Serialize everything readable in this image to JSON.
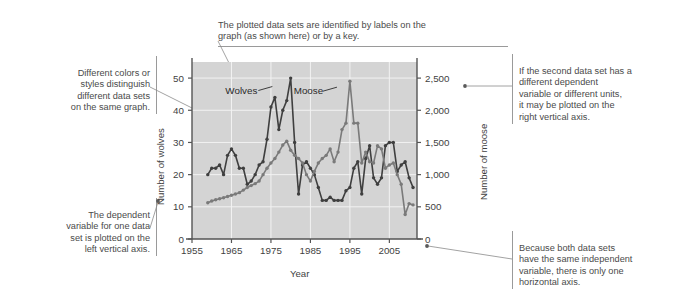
{
  "figure": {
    "background": "#ffffff",
    "plot_background": "#d4d4d4",
    "grid_color": "#f2f2f2",
    "axis_color": "#555555"
  },
  "annotations": {
    "top": {
      "name": "callout-labels",
      "text": "The plotted data sets are identified by labels on the\ngraph (as shown here) or by a key."
    },
    "left_top": {
      "name": "callout-colors-styles",
      "text": "Different colors or\nstyles distinguish\ndifferent data sets\non the same graph."
    },
    "left_bottom": {
      "name": "callout-dependent-variable",
      "text": "The dependent\nvariable for one data\nset is plotted on the\nleft vertical axis."
    },
    "right_top": {
      "name": "callout-second-axis",
      "text": "If the second data set has a\ndifferent dependent\nvariable or different units,\nit may be plotted on the\nright vertical axis."
    },
    "right_bottom": {
      "name": "callout-independent-variable",
      "text": "Because both data sets\nhave the same independent\nvariable, there is only one\nhorizontal axis."
    }
  },
  "chart_data": {
    "type": "line",
    "title": "",
    "xlabel": "Year",
    "ylabel": "Number of wolves",
    "y2label": "Number of moose",
    "xlim": [
      1955,
      2012
    ],
    "xticks": [
      1955,
      1965,
      1975,
      1985,
      1995,
      2005
    ],
    "xticklabels": [
      "1955",
      "1965",
      "1975",
      "1985",
      "1995",
      "2005"
    ],
    "ylim": [
      0,
      55
    ],
    "yticks": [
      0,
      10,
      20,
      30,
      40,
      50
    ],
    "yticklabels": [
      "0",
      "10",
      "20",
      "30",
      "40",
      "50"
    ],
    "y2lim": [
      0,
      2750
    ],
    "y2ticks": [
      0,
      500,
      1000,
      1500,
      2000,
      2500
    ],
    "y2ticklabels": [
      "0",
      "500",
      "1,000",
      "1,500",
      "2,000",
      "2,500"
    ],
    "grid": true,
    "legend_position": "inline-labels",
    "series": [
      {
        "name": "Wolves",
        "axis": "left",
        "color": "#3f3f3f",
        "label_x": 1967.5,
        "label_y": 45.2,
        "x": [
          1959,
          1960,
          1961,
          1962,
          1963,
          1964,
          1965,
          1966,
          1967,
          1968,
          1969,
          1970,
          1971,
          1972,
          1973,
          1974,
          1975,
          1976,
          1977,
          1978,
          1979,
          1980,
          1981,
          1982,
          1983,
          1984,
          1985,
          1986,
          1987,
          1988,
          1989,
          1990,
          1991,
          1992,
          1993,
          1994,
          1995,
          1996,
          1997,
          1998,
          1999,
          2000,
          2001,
          2002,
          2003,
          2004,
          2005,
          2006,
          2007,
          2008,
          2009,
          2010,
          2011
        ],
        "y": [
          20,
          22,
          22,
          23,
          20,
          26,
          28,
          26,
          22,
          22,
          17,
          18,
          20,
          23,
          24,
          31,
          41,
          44,
          34,
          40,
          43,
          50,
          30,
          14,
          23,
          24,
          22,
          20,
          16,
          12,
          12,
          13,
          12,
          12,
          12,
          15,
          16,
          22,
          24,
          14,
          25,
          29,
          19,
          17,
          19,
          29,
          30,
          30,
          21,
          23,
          24,
          19,
          16
        ]
      },
      {
        "name": "Moose",
        "axis": "right",
        "color": "#7a7a7a",
        "label_x": 1984.5,
        "label_y": 45.0,
        "x": [
          1959,
          1960,
          1961,
          1962,
          1963,
          1964,
          1965,
          1966,
          1967,
          1968,
          1969,
          1970,
          1971,
          1972,
          1973,
          1974,
          1975,
          1976,
          1977,
          1978,
          1979,
          1980,
          1981,
          1982,
          1983,
          1984,
          1985,
          1986,
          1987,
          1988,
          1989,
          1990,
          1991,
          1992,
          1993,
          1994,
          1995,
          1996,
          1997,
          1998,
          1999,
          2000,
          2001,
          2002,
          2003,
          2004,
          2005,
          2006,
          2007,
          2008,
          2009,
          2010,
          2011
        ],
        "y": [
          563,
          590,
          610,
          625,
          640,
          660,
          680,
          700,
          720,
          760,
          800,
          830,
          860,
          900,
          1000,
          1100,
          1180,
          1250,
          1350,
          1460,
          1520,
          1380,
          1300,
          1250,
          1180,
          1000,
          900,
          1050,
          1180,
          1250,
          1300,
          1400,
          1200,
          1350,
          1700,
          1800,
          2450,
          1800,
          1800,
          1180,
          1350,
          1200,
          1180,
          1450,
          1400,
          1100,
          1150,
          1180,
          1000,
          850,
          380,
          550,
          530
        ]
      }
    ]
  }
}
